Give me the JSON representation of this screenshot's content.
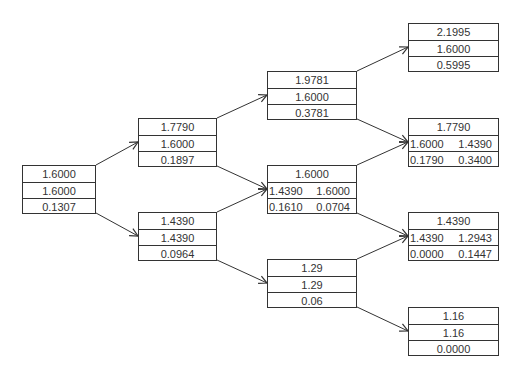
{
  "diagram": {
    "type": "binomial-tree",
    "nodes": [
      {
        "id": "n0",
        "x": 22,
        "y": 165,
        "w": 74,
        "rows": [
          [
            "1.6000"
          ],
          [
            "1.6000"
          ],
          [
            "0.1307"
          ]
        ]
      },
      {
        "id": "n1u",
        "x": 138,
        "y": 118,
        "w": 79,
        "rows": [
          [
            "1.7790"
          ],
          [
            "1.6000"
          ],
          [
            "0.1897"
          ]
        ]
      },
      {
        "id": "n1d",
        "x": 138,
        "y": 212,
        "w": 79,
        "rows": [
          [
            "1.4390"
          ],
          [
            "1.4390"
          ],
          [
            "0.0964"
          ]
        ]
      },
      {
        "id": "n2uu",
        "x": 267,
        "y": 71,
        "w": 90,
        "rows": [
          [
            "1.9781"
          ],
          [
            "1.6000"
          ],
          [
            "0.3781"
          ]
        ]
      },
      {
        "id": "n2ud",
        "x": 267,
        "y": 165,
        "w": 90,
        "rows": [
          [
            "1.6000"
          ],
          [
            "1.4390",
            "1.6000"
          ],
          [
            "0.1610",
            "0.0704"
          ]
        ]
      },
      {
        "id": "n2dd",
        "x": 267,
        "y": 259,
        "w": 90,
        "rows": [
          [
            "1.29"
          ],
          [
            "1.29"
          ],
          [
            "0.06"
          ]
        ]
      },
      {
        "id": "n3uuu",
        "x": 408,
        "y": 23,
        "w": 91,
        "rows": [
          [
            "2.1995"
          ],
          [
            "1.6000"
          ],
          [
            "0.5995"
          ]
        ]
      },
      {
        "id": "n3uud",
        "x": 408,
        "y": 118,
        "w": 91,
        "rows": [
          [
            "1.7790"
          ],
          [
            "1.6000",
            "1.4390"
          ],
          [
            "0.1790",
            "0.3400"
          ]
        ]
      },
      {
        "id": "n3udd",
        "x": 408,
        "y": 212,
        "w": 91,
        "rows": [
          [
            "1.4390"
          ],
          [
            "1.4390",
            "1.2943"
          ],
          [
            "0.0000",
            "0.1447"
          ]
        ]
      },
      {
        "id": "n3ddd",
        "x": 408,
        "y": 307,
        "w": 91,
        "rows": [
          [
            "1.16"
          ],
          [
            "1.16"
          ],
          [
            "0.0000"
          ]
        ]
      }
    ],
    "edges": [
      [
        "n0",
        "n1u"
      ],
      [
        "n0",
        "n1d"
      ],
      [
        "n1u",
        "n2uu"
      ],
      [
        "n1u",
        "n2ud"
      ],
      [
        "n1d",
        "n2ud"
      ],
      [
        "n1d",
        "n2dd"
      ],
      [
        "n2uu",
        "n3uuu"
      ],
      [
        "n2uu",
        "n3uud"
      ],
      [
        "n2ud",
        "n3uud"
      ],
      [
        "n2ud",
        "n3udd"
      ],
      [
        "n2dd",
        "n3udd"
      ],
      [
        "n2dd",
        "n3ddd"
      ]
    ],
    "line_color": "#333333"
  }
}
